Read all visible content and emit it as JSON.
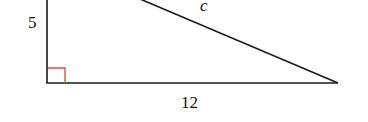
{
  "diagram": {
    "type": "right-triangle",
    "labels": {
      "vertical_leg": "5",
      "hypotenuse": "c",
      "horizontal_leg": "12"
    },
    "colors": {
      "lines": "#1a1a1a",
      "right_angle_marker": "#d9533a",
      "background": "#ffffff"
    }
  }
}
